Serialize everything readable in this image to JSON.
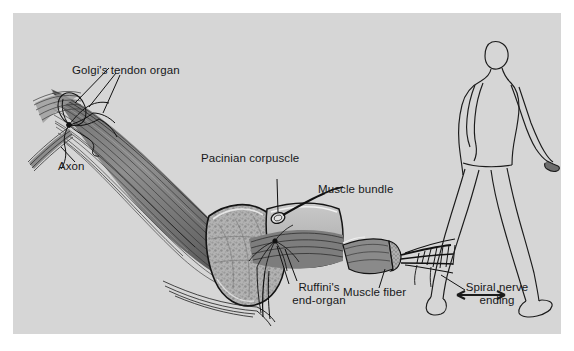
{
  "figure": {
    "kind": "anatomical-illustration",
    "background_color": "#d6d6d6",
    "ink_color": "#16181a",
    "border_color": "#ffffff"
  },
  "labels": {
    "golgi": "Golgi's tendon organ",
    "axon": "Axon",
    "pacinian": "Pacinian corpuscle",
    "muscle_bundle": "Muscle bundle",
    "ruffini_line1": "Ruffini's",
    "ruffini_line2": "end-organ",
    "muscle_fiber": "Muscle fiber",
    "spiral_line1": "Spiral nerve",
    "spiral_line2": "ending"
  },
  "inset": {
    "name": "walking-human-figure",
    "description": "Line drawing of a person walking to the right with a double-headed arrow between the feet indicating stride"
  }
}
